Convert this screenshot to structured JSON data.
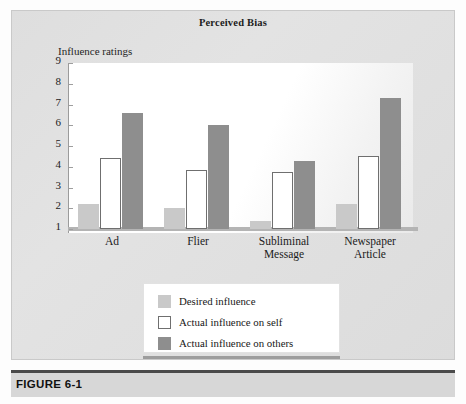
{
  "figure": {
    "caption_label": "FIGURE 6-1"
  },
  "chart_data": {
    "type": "bar",
    "title": "Perceived Bias",
    "xlabel": "",
    "ylabel": "Influence ratings",
    "ylim": [
      1,
      9
    ],
    "yticks": [
      1,
      2,
      3,
      4,
      5,
      6,
      7,
      8,
      9
    ],
    "grid": false,
    "legend_position": "bottom-center",
    "categories": [
      "Ad",
      "Flier",
      "Subliminal Message",
      "Newspaper Article"
    ],
    "category_lines": [
      [
        "Ad"
      ],
      [
        "Flier"
      ],
      [
        "Subliminal",
        "Message"
      ],
      [
        "Newspaper",
        "Article"
      ]
    ],
    "series": [
      {
        "name": "Desired influence",
        "color": "#c9c9c9",
        "values": [
          2.2,
          2.0,
          1.4,
          2.2
        ]
      },
      {
        "name": "Actual influence on self",
        "color": "#ffffff",
        "values": [
          4.4,
          3.85,
          3.75,
          4.5
        ]
      },
      {
        "name": "Actual influence on others",
        "color": "#8e8e8e",
        "values": [
          6.6,
          6.0,
          4.3,
          7.3
        ]
      }
    ]
  }
}
